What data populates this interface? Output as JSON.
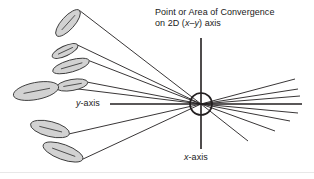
{
  "figure": {
    "width": 314,
    "height": 179,
    "background": "#ffffff",
    "type": "schematic-diagram",
    "caption_title": {
      "line1": "Point or Area of Convergence",
      "line2_prefix": "on 2D (",
      "line2_x": "x",
      "line2_dash": "–",
      "line2_y": "y",
      "line2_suffix": ") axis"
    },
    "axis_labels": {
      "y_italic": "y",
      "y_rest": "-axis",
      "x_italic": "x",
      "x_rest": "-axis"
    },
    "colors": {
      "stroke": "#231f20",
      "ellipse_fill": "#d2d2d2",
      "ellipse_stroke": "#3a3a3a",
      "axis": "#231f20",
      "footer_rule": "#e8e8e8",
      "text": "#1a1a1a"
    },
    "convergence": {
      "center_x": 201,
      "center_y": 104,
      "radius": 11,
      "label": "circle marking the point or area of convergence"
    },
    "axes": {
      "horizontal": {
        "x1": 110,
        "y1": 104,
        "x2": 302,
        "y2": 104
      },
      "vertical": {
        "x1": 201,
        "y1": 38,
        "x2": 201,
        "y2": 149
      }
    },
    "ellipses": [
      {
        "cx": 68,
        "cy": 23,
        "rx": 17,
        "ry": 6.5,
        "angle": -48,
        "tail_x": 201,
        "tail_y": 104
      },
      {
        "cx": 65,
        "cy": 51,
        "rx": 14,
        "ry": 5,
        "angle": -25,
        "tail_x": 201,
        "tail_y": 104
      },
      {
        "cx": 71,
        "cy": 66,
        "rx": 19,
        "ry": 6,
        "angle": -16,
        "tail_x": 201,
        "tail_y": 104
      },
      {
        "cx": 72,
        "cy": 85,
        "rx": 16,
        "ry": 5.5,
        "angle": -10,
        "tail_x": 201,
        "tail_y": 104
      },
      {
        "cx": 36,
        "cy": 91,
        "rx": 23,
        "ry": 8.5,
        "angle": -11,
        "tail_x": 201,
        "tail_y": 104
      },
      {
        "cx": 50,
        "cy": 129,
        "rx": 20,
        "ry": 7.5,
        "angle": 14,
        "tail_x": 201,
        "tail_y": 104
      },
      {
        "cx": 63,
        "cy": 152,
        "rx": 21,
        "ry": 7.5,
        "angle": 20,
        "tail_x": 201,
        "tail_y": 104
      }
    ],
    "right_rays": [
      {
        "x2": 295,
        "y2": 79
      },
      {
        "x2": 298,
        "y2": 89
      },
      {
        "x2": 300,
        "y2": 96
      },
      {
        "x2": 298,
        "y2": 113
      },
      {
        "x2": 290,
        "y2": 121
      },
      {
        "x2": 275,
        "y2": 131
      },
      {
        "x2": 248,
        "y2": 141
      }
    ]
  }
}
